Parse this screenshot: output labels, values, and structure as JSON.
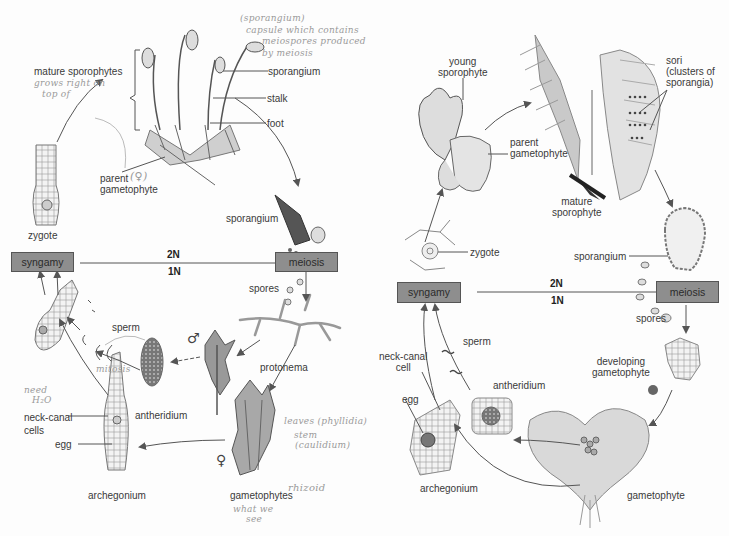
{
  "moss_cycle": {
    "boxes": {
      "syngamy": "syngamy",
      "meiosis": "meiosis"
    },
    "ploidy": {
      "diploid": "2N",
      "haploid": "1N"
    },
    "labels": {
      "mature_sporophytes": "mature sporophytes",
      "sporangium_top": "sporangium",
      "stalk": "stalk",
      "foot": "foot",
      "parent_gametophyte": "parent\ngametophyte",
      "zygote": "zygote",
      "sporangium_capsule": "sporangium",
      "spores": "spores",
      "protonema": "protonema",
      "sperm": "sperm",
      "antheridium": "antheridium",
      "neck_canal_cells": "neck-canal\ncells",
      "egg": "egg",
      "archegonium": "archegonium",
      "gametophytes": "gametophytes"
    },
    "symbols": {
      "male": "♂",
      "female": "♀"
    },
    "handwritten": {
      "sporangium_note_1": "(sporangium)",
      "sporangium_note_2": "capsule which contains",
      "sporangium_note_3": "meiospores produced",
      "sporangium_note_4": "by meiosis",
      "grows_1": "grows right on",
      "grows_2": "top of",
      "female_mark": "(♀)",
      "mitosis": "mitosis",
      "need_water_1": "need",
      "need_water_2": "H₂O",
      "leaves": "leaves (phyllidia)",
      "stem_1": "stem",
      "stem_2": "(caulidium)",
      "rhizoid": "rhizoid",
      "what_we_see_1": "what we",
      "what_we_see_2": "see"
    }
  },
  "fern_cycle": {
    "boxes": {
      "syngamy": "syngamy",
      "meiosis": "meiosis"
    },
    "ploidy": {
      "diploid": "2N",
      "haploid": "1N"
    },
    "labels": {
      "young_sporophyte": "young\nsporophyte",
      "parent_gametophyte": "parent\ngametophyte",
      "mature_sporophyte": "mature\nsporophyte",
      "sori": "sori\n(clusters of\nsporangia)",
      "zygote": "zygote",
      "sporangium": "sporangium",
      "spores": "spores",
      "developing_gametophyte": "developing\ngametophyte",
      "gametophyte": "gametophyte",
      "sperm": "sperm",
      "neck_canal_cell": "neck-canal\ncell",
      "antheridium": "antheridium",
      "egg": "egg",
      "archegonium": "archegonium"
    }
  },
  "colors": {
    "box_fill": "#8e8e8e",
    "box_border": "#555555",
    "arrow": "#555555",
    "handwriting": "#9a9a9a",
    "label_text": "#3a3a3a"
  }
}
